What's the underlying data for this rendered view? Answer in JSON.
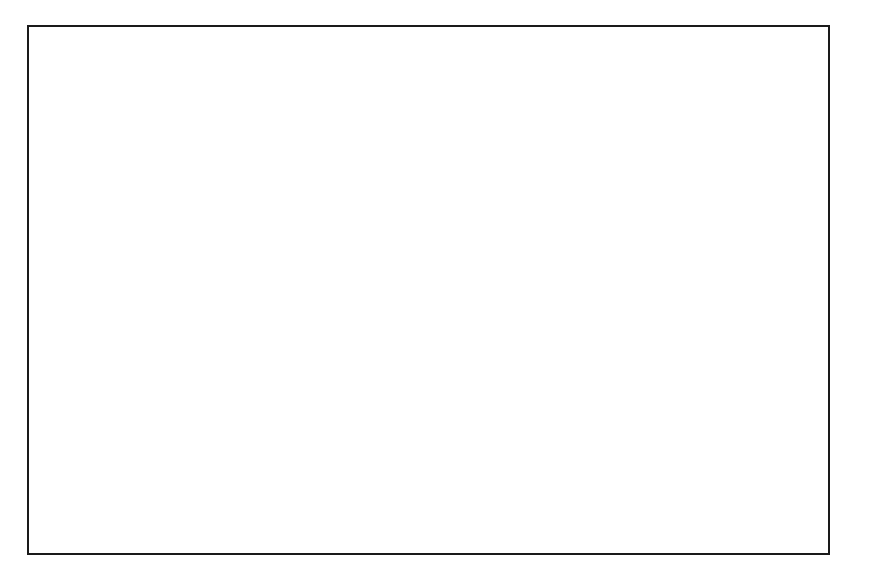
{
  "figure": {
    "title": "COMPROMISE OF 1850",
    "type": "historical-thematic-map",
    "region": "United States, 1850"
  },
  "colors": {
    "slave_fill": "#9c9c9c",
    "free_stripe_light": "#e8e8e8",
    "free_stripe_dark": "#9c9c9c",
    "sovereignty_stripe": "#ffffff",
    "water": "#ffffff",
    "ink": "#0d0d0d",
    "frame": "#1a1a1a"
  },
  "lines": {
    "missouri_compromise": {
      "name": "MISSOURI COMPROMISE LINE",
      "latitude": "36°30'N"
    },
    "mason_dixon": {
      "name_part1": "MASON-DIXON",
      "name_part2": "LINE"
    }
  },
  "legend": {
    "items": [
      {
        "pattern": "vertical-stripes",
        "label": "Free states and territories"
      },
      {
        "pattern": "solid-gray",
        "label": "Slave states"
      },
      {
        "pattern": "diagonal-stripes",
        "label": "Open to slavery by popular sovereignty,",
        "label2": "compromise of 1850"
      }
    ]
  },
  "territories": [
    {
      "id": "oregon",
      "name_line1": "OREGON",
      "name_line2": "TERRITORY",
      "status": "free",
      "x": 163,
      "y": 103
    },
    {
      "id": "minnesota",
      "name_line1": "MINNESOTA",
      "name_line2": "TERRITORY",
      "status": "free",
      "x": 430,
      "y": 110
    },
    {
      "id": "unorganized",
      "name_line1": "UNORGANIZED",
      "name_line2": "TERRITORY",
      "status": "free",
      "x": 337,
      "y": 208
    },
    {
      "id": "utah",
      "name_line1": "UTAH",
      "name_line2": "TERRITORY",
      "status": "sovereignty",
      "x": 201,
      "y": 224
    },
    {
      "id": "newmexico",
      "name_line1": "NEW MEXICO",
      "name_line2": "TERRITORY",
      "status": "sovereignty",
      "x": 229,
      "y": 342
    }
  ],
  "california": {
    "line1": "CAL.,",
    "line2": "admitted",
    "line3": "as free state,",
    "line4": "1850)",
    "status": "free"
  },
  "states": [
    {
      "id": "wis",
      "label": "WIS.",
      "status": "free",
      "x": 520,
      "y": 158
    },
    {
      "id": "mich",
      "label": "MICH.",
      "status": "free",
      "x": 594,
      "y": 182
    },
    {
      "id": "iowa",
      "label": "IOWA",
      "status": "free",
      "x": 472,
      "y": 212
    },
    {
      "id": "ill",
      "label": "ILL.",
      "status": "free",
      "x": 533,
      "y": 252
    },
    {
      "id": "ind",
      "label": "IND.",
      "status": "free",
      "x": 578,
      "y": 248
    },
    {
      "id": "ohio",
      "label": "OHIO",
      "status": "free",
      "x": 626,
      "y": 236
    },
    {
      "id": "penn",
      "label": "PENN.",
      "status": "free",
      "x": 690,
      "y": 208
    },
    {
      "id": "ny",
      "label": "N.Y.",
      "status": "free",
      "x": 730,
      "y": 165
    },
    {
      "id": "maine",
      "label": "MAINE",
      "status": "free",
      "x": 788,
      "y": 85
    },
    {
      "id": "nh",
      "label": "N.H.",
      "status": "free",
      "x": 728,
      "y": 92
    },
    {
      "id": "vt",
      "label": "VT.",
      "status": "free",
      "x": 721,
      "y": 108
    },
    {
      "id": "mass",
      "label": "MASS.",
      "status": "free",
      "x": 805,
      "y": 155
    },
    {
      "id": "ri",
      "label": "R.I.",
      "status": "free",
      "x": 801,
      "y": 185
    },
    {
      "id": "conn",
      "label": "CONN.",
      "status": "free",
      "x": 799,
      "y": 204
    },
    {
      "id": "nj",
      "label": "N.J.",
      "status": "free",
      "x": 777,
      "y": 227
    },
    {
      "id": "del",
      "label": "DEL.",
      "status": "slave",
      "x": 775,
      "y": 250
    },
    {
      "id": "md",
      "label": "MD.",
      "status": "slave",
      "x": 769,
      "y": 266
    },
    {
      "id": "va",
      "label": "VA.",
      "status": "slave",
      "x": 681,
      "y": 268
    },
    {
      "id": "mo",
      "label": "MO.",
      "status": "slave",
      "x": 462,
      "y": 281
    },
    {
      "id": "ky",
      "label": "KY.",
      "status": "slave",
      "x": 594,
      "y": 295
    },
    {
      "id": "tenn",
      "label": "TENN.",
      "status": "slave",
      "x": 585,
      "y": 331
    },
    {
      "id": "nc",
      "label": "N.C.",
      "status": "slave",
      "x": 683,
      "y": 320
    },
    {
      "id": "sc",
      "label": "S.C.",
      "status": "slave",
      "x": 690,
      "y": 358
    },
    {
      "id": "ark",
      "label": "ARK.",
      "status": "slave",
      "x": 487,
      "y": 362
    },
    {
      "id": "miss",
      "label": "MISS.",
      "status": "slave",
      "x": 537,
      "y": 395
    },
    {
      "id": "ala",
      "label": "ALA.",
      "status": "slave",
      "x": 588,
      "y": 389
    },
    {
      "id": "ga",
      "label": "GA.",
      "status": "slave",
      "x": 643,
      "y": 391
    },
    {
      "id": "la",
      "label": "LA.",
      "status": "slave",
      "x": 489,
      "y": 432
    },
    {
      "id": "fla",
      "label": "FLA.",
      "status": "slave",
      "x": 673,
      "y": 442
    },
    {
      "id": "texas",
      "label": "TEXAS",
      "status": "slave",
      "x": 383,
      "y": 429
    }
  ]
}
